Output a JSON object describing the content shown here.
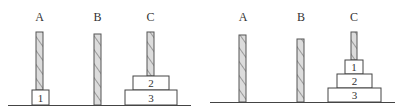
{
  "diagram": {
    "title": "",
    "panels": [
      {
        "id": "state-before",
        "peg_labels": [
          "A",
          "B",
          "C"
        ],
        "pegs": {
          "A": {
            "disks": [
              "1"
            ]
          },
          "B": {
            "disks": []
          },
          "C": {
            "disks": [
              "3",
              "2"
            ]
          }
        }
      },
      {
        "id": "state-after",
        "peg_labels": [
          "A",
          "B",
          "C"
        ],
        "pegs": {
          "A": {
            "disks": []
          },
          "B": {
            "disks": []
          },
          "C": {
            "disks": [
              "3",
              "2",
              "1"
            ]
          }
        }
      }
    ]
  },
  "labels": {
    "left": {
      "a": "A",
      "b": "B",
      "c": "C"
    },
    "right": {
      "a": "A",
      "b": "B",
      "c": "C"
    }
  },
  "disks": {
    "left": {
      "d1": "1",
      "d2": "2",
      "d3": "3"
    },
    "right": {
      "d1": "1",
      "d2": "2",
      "d3": "3"
    }
  },
  "colors": {
    "peg_fill": "#d8d8d8",
    "peg_hatch": "#9a9a9a",
    "stroke": "#444444",
    "background": "#ffffff"
  }
}
